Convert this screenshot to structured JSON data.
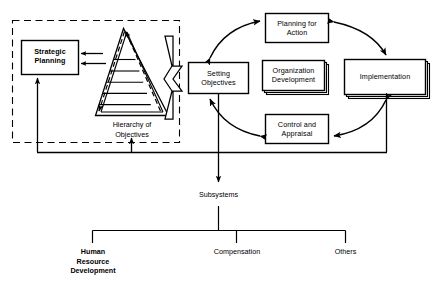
{
  "diagram": {
    "colors": {
      "stroke": "#000000",
      "fill": "#ffffff",
      "background": "#ffffff"
    },
    "dashed_region": {
      "name": "strategic-planning-region",
      "style": "dashed"
    },
    "boxes": [
      {
        "id": "strategic-planning",
        "label": "Strategic\nPlanning",
        "bold": true,
        "stacked": false
      },
      {
        "id": "setting-objectives",
        "label": "Setting\nObjectives",
        "bold": false,
        "stacked": false
      },
      {
        "id": "planning-for-action",
        "label": "Planning for\nAction",
        "bold": false,
        "stacked": false
      },
      {
        "id": "implementation",
        "label": "Implementation",
        "bold": false,
        "stacked": true
      },
      {
        "id": "control-and-appraisal",
        "label": "Control and\nAppraisal",
        "bold": false,
        "stacked": false
      },
      {
        "id": "organization-development",
        "label": "Organization\nDevelopment",
        "bold": false,
        "stacked": true
      }
    ],
    "pyramid": {
      "id": "hierarchy-of-objectives",
      "caption": "Hierarchy of\nObjectives",
      "tiers": 6,
      "arrow_style": "dashed-double-headed"
    },
    "subsystems": {
      "id": "subsystems",
      "label": "Subsystems",
      "children": [
        {
          "id": "human-resource-development",
          "label": "Human\nResource\nDevelopment",
          "bold": true
        },
        {
          "id": "compensation",
          "label": "Compensation",
          "bold": false
        },
        {
          "id": "others",
          "label": "Others",
          "bold": false
        }
      ]
    },
    "connectors": {
      "pyramid_to_strategic": "double-arrow-left",
      "pyramid_to_setting_objectives": "block-arrow-right",
      "cycle": "clockwise-double-headed-curved-arrows",
      "feedback_to_strategic": "arrow-up",
      "feedback_to_pyramid": "arrow-up",
      "setting_objectives_down": "arrow-down",
      "implementation_down": "arrow-down",
      "subsystems_down": "arrow-down"
    }
  }
}
